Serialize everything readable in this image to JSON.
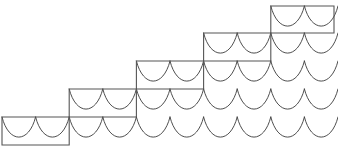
{
  "figure": {
    "canvas": {
      "width": 338,
      "height": 154,
      "background": "#ffffff"
    },
    "styles": {
      "scallop_stroke": "#3a3a3a",
      "scallop_stroke_width": 0.9,
      "staircase_stroke": "#555555",
      "staircase_stroke_width": 1.1
    },
    "grid": {
      "cell_width": 33.6,
      "cell_height": 28.0,
      "origin_x": 2,
      "origin_y": 145,
      "columns": 10,
      "rows": 5,
      "arch_depth_ratio": 0.62,
      "description": "Field of downward hanging arches (scallops) with cusps at the top corners of each cell"
    },
    "scallop_rows": [
      {
        "row": 1,
        "y_top": 117,
        "y_bottom": 145,
        "x_start": 2,
        "x_end": 338,
        "arch_count": 10
      },
      {
        "row": 2,
        "y_top": 89,
        "y_bottom": 117,
        "x_start": 69.2,
        "x_end": 338,
        "arch_count": 8
      },
      {
        "row": 3,
        "y_top": 61,
        "y_bottom": 89,
        "x_start": 136.4,
        "x_end": 338,
        "arch_count": 6
      },
      {
        "row": 4,
        "y_top": 33,
        "y_bottom": 61,
        "x_start": 203.6,
        "x_end": 338,
        "arch_count": 4
      },
      {
        "row": 5,
        "y_top": 6,
        "y_bottom": 33,
        "x_start": 270.8,
        "x_end": 338,
        "arch_count": 2
      }
    ],
    "staircase": {
      "step_count": 5,
      "step_width": 67.2,
      "step_height": 28,
      "arches_per_step": 2,
      "bottom_left": {
        "x": 2,
        "y": 145
      },
      "top_right": {
        "x": 334,
        "y": 6
      },
      "outline_points": "2,145 2,117 69.2,117 69.2,89 136.4,89 136.4,61 203.6,61 203.6,33 270.8,33 270.8,6 334,6 334,33 270.8,33 270.8,61 203.6,61 203.6,89 136.4,89 136.4,117 69.2,117 69.2,145 2,145",
      "risers_x": [
        2,
        69.2,
        136.4,
        203.6,
        270.8,
        334
      ],
      "treads_y": [
        145,
        117,
        89,
        61,
        33,
        6
      ]
    }
  }
}
